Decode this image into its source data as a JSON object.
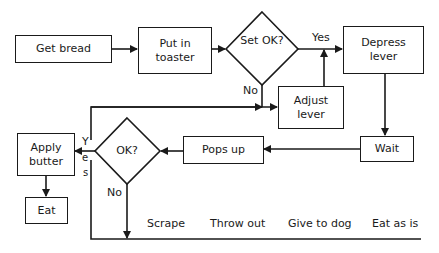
{
  "nodes": {
    "get_bread": "Get bread",
    "put_in_toaster": "Put in toaster",
    "set_ok": "Set OK?",
    "depress_lever": "Depress lever",
    "adjust_lever": "Adjust lever",
    "wait": "Wait",
    "pops_up": "Pops up",
    "ok": "OK?",
    "apply_butter": "Apply butter",
    "eat": "Eat"
  },
  "edge_labels": {
    "set_ok_yes": "Yes",
    "set_ok_no": "No",
    "ok_yes_y": "Y",
    "ok_yes_e": "e",
    "ok_yes_s": "s",
    "ok_no": "No"
  },
  "outcomes": [
    "Scrape",
    "Throw out",
    "Give to dog",
    "Eat as is"
  ]
}
